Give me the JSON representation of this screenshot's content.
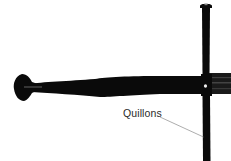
{
  "figure": {
    "background": "#ffffff",
    "ink_color": "#0a0a0a",
    "blade_color": "#1c1c1c",
    "highlight_color": "#e8e8e8",
    "leader_line_color": "#8a8a8a"
  },
  "labels": [
    {
      "text": "Quillons",
      "target": "quillon"
    }
  ]
}
